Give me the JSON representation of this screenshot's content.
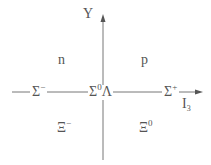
{
  "diagram": {
    "axes": {
      "y_label": "Y",
      "x_label": "I",
      "x_label_sub": "3"
    },
    "particles": [
      {
        "symbol": "n",
        "sup": ""
      },
      {
        "symbol": "p",
        "sup": ""
      },
      {
        "symbol": "Σ",
        "sup": "−"
      },
      {
        "symbol": "Σ",
        "sup": "0",
        "extra": "Λ"
      },
      {
        "symbol": "Σ",
        "sup": "+"
      },
      {
        "symbol": "Ξ",
        "sup": "−"
      },
      {
        "symbol": "Ξ",
        "sup": "0"
      }
    ],
    "colors": {
      "line": "#666666",
      "text": "#555555"
    }
  }
}
